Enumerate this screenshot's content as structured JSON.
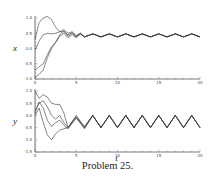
{
  "caption": "Problem 25.",
  "chart_data": [
    {
      "type": "line",
      "title": "",
      "xlabel": "",
      "ylabel": "x",
      "xlim": [
        0,
        20
      ],
      "ylim": [
        -1.0,
        1.0
      ],
      "xticks": [
        "0",
        "5",
        "10",
        "15",
        "20"
      ],
      "yticks": [
        "1.0",
        "0.5",
        "0.0",
        "-0.5",
        "-1.0"
      ],
      "grid": false,
      "series": [
        {
          "name": "trajectory 1",
          "t": [
            0,
            0.5,
            1,
            1.5,
            2,
            2.5,
            3,
            3.5,
            4,
            4.5,
            5,
            5.5,
            6,
            7,
            8,
            9,
            10,
            11,
            12,
            13,
            14,
            15,
            16,
            17,
            18,
            19,
            20
          ],
          "values": [
            0.3,
            0.85,
            1.0,
            1.05,
            0.95,
            0.7,
            0.55,
            0.62,
            0.5,
            0.55,
            0.42,
            0.5,
            0.38,
            0.48,
            0.38,
            0.48,
            0.38,
            0.48,
            0.38,
            0.48,
            0.38,
            0.48,
            0.38,
            0.48,
            0.38,
            0.48,
            0.38
          ]
        },
        {
          "name": "trajectory 2",
          "t": [
            0,
            0.5,
            1,
            1.5,
            2,
            2.5,
            3,
            3.5,
            4,
            4.5,
            5,
            5.5,
            6,
            7,
            8,
            9,
            10,
            11,
            12,
            13,
            14,
            15,
            16,
            17,
            18,
            19,
            20
          ],
          "values": [
            -0.05,
            0.25,
            0.45,
            0.5,
            0.48,
            0.5,
            0.55,
            0.55,
            0.45,
            0.52,
            0.4,
            0.5,
            0.38,
            0.48,
            0.38,
            0.48,
            0.38,
            0.48,
            0.38,
            0.48,
            0.38,
            0.48,
            0.38,
            0.48,
            0.38,
            0.48,
            0.38
          ]
        },
        {
          "name": "trajectory 3",
          "t": [
            0,
            0.5,
            1,
            1.5,
            2,
            2.5,
            3,
            3.5,
            4,
            4.5,
            5,
            5.5,
            6,
            7,
            8,
            9,
            10,
            11,
            12,
            13,
            14,
            15,
            16,
            17,
            18,
            19,
            20
          ],
          "values": [
            -0.7,
            -0.6,
            -0.5,
            -0.2,
            0.05,
            0.2,
            0.45,
            0.58,
            0.4,
            0.5,
            0.38,
            0.48,
            0.38,
            0.48,
            0.38,
            0.48,
            0.38,
            0.48,
            0.38,
            0.48,
            0.38,
            0.48,
            0.38,
            0.48,
            0.38,
            0.48,
            0.38
          ]
        },
        {
          "name": "trajectory 4",
          "t": [
            0,
            0.5,
            1,
            1.5,
            2,
            2.5,
            3,
            3.5,
            4,
            4.5,
            5,
            5.5,
            6,
            7,
            8,
            9,
            10,
            11,
            12,
            13,
            14,
            15,
            16,
            17,
            18,
            19,
            20
          ],
          "values": [
            -0.95,
            -0.85,
            -0.7,
            -0.3,
            0.0,
            0.2,
            0.4,
            0.5,
            0.35,
            0.45,
            0.35,
            0.48,
            0.38,
            0.48,
            0.38,
            0.48,
            0.38,
            0.48,
            0.38,
            0.48,
            0.38,
            0.48,
            0.38,
            0.48,
            0.38,
            0.48,
            0.38
          ]
        }
      ]
    },
    {
      "type": "line",
      "title": "",
      "xlabel": "t",
      "ylabel": "y",
      "xlim": [
        0,
        20
      ],
      "ylim": [
        -1.5,
        1.0
      ],
      "xticks": [
        "0",
        "5",
        "10",
        "15",
        "20"
      ],
      "yticks": [
        "1.0",
        "0.5",
        "0.0",
        "-0.5",
        "-1.0",
        "-1.5"
      ],
      "grid": false,
      "series": [
        {
          "name": "trajectory 1",
          "t": [
            0,
            0.5,
            1,
            1.5,
            2,
            2.5,
            3,
            3.5,
            4,
            5,
            6,
            7,
            8,
            9,
            10,
            11,
            12,
            13,
            14,
            15,
            16,
            17,
            18,
            19,
            20
          ],
          "values": [
            1.0,
            0.7,
            0.85,
            0.75,
            0.5,
            0.45,
            0.45,
            0.1,
            -0.5,
            0.0,
            -0.5,
            0.0,
            -0.5,
            0.0,
            -0.5,
            0.0,
            -0.5,
            0.0,
            -0.5,
            0.0,
            -0.5,
            0.0,
            -0.5,
            0.0,
            -0.5
          ]
        },
        {
          "name": "trajectory 2",
          "t": [
            0,
            0.5,
            1,
            1.5,
            2,
            2.5,
            3,
            3.5,
            4,
            5,
            6,
            7,
            8,
            9,
            10,
            11,
            12,
            13,
            14,
            15,
            16,
            17,
            18,
            19,
            20
          ],
          "values": [
            0.2,
            0.5,
            0.6,
            0.35,
            0.0,
            -0.15,
            0.0,
            -0.3,
            -0.5,
            -0.05,
            -0.45,
            0.0,
            -0.5,
            0.0,
            -0.5,
            0.0,
            -0.5,
            0.0,
            -0.5,
            0.0,
            -0.5,
            0.0,
            -0.5,
            0.0,
            -0.5
          ]
        },
        {
          "name": "trajectory 3",
          "t": [
            0,
            0.5,
            1,
            1.5,
            2,
            2.5,
            3,
            3.5,
            4,
            5,
            6,
            7,
            8,
            9,
            10,
            11,
            12,
            13,
            14,
            15,
            16,
            17,
            18,
            19,
            20
          ],
          "values": [
            0.1,
            0.55,
            0.3,
            -0.2,
            -0.45,
            -0.3,
            -0.2,
            -0.4,
            -0.55,
            -0.1,
            -0.5,
            0.0,
            -0.5,
            0.0,
            -0.5,
            0.0,
            -0.5,
            0.0,
            -0.5,
            0.0,
            -0.5,
            0.0,
            -0.5,
            0.0,
            -0.5
          ]
        },
        {
          "name": "trajectory 4",
          "t": [
            0,
            0.5,
            1,
            1.5,
            2,
            2.5,
            3,
            3.5,
            4,
            5,
            6,
            7,
            8,
            9,
            10,
            11,
            12,
            13,
            14,
            15,
            16,
            17,
            18,
            19,
            20
          ],
          "values": [
            0.0,
            0.3,
            -0.3,
            -0.8,
            -1.0,
            -0.75,
            -0.6,
            -0.55,
            -0.5,
            -0.1,
            -0.55,
            0.0,
            -0.5,
            0.0,
            -0.5,
            0.0,
            -0.5,
            0.0,
            -0.5,
            0.0,
            -0.5,
            0.0,
            -0.5,
            0.0,
            -0.5
          ]
        }
      ]
    }
  ],
  "colors": {
    "line": "#333333",
    "axis": "#555555"
  }
}
